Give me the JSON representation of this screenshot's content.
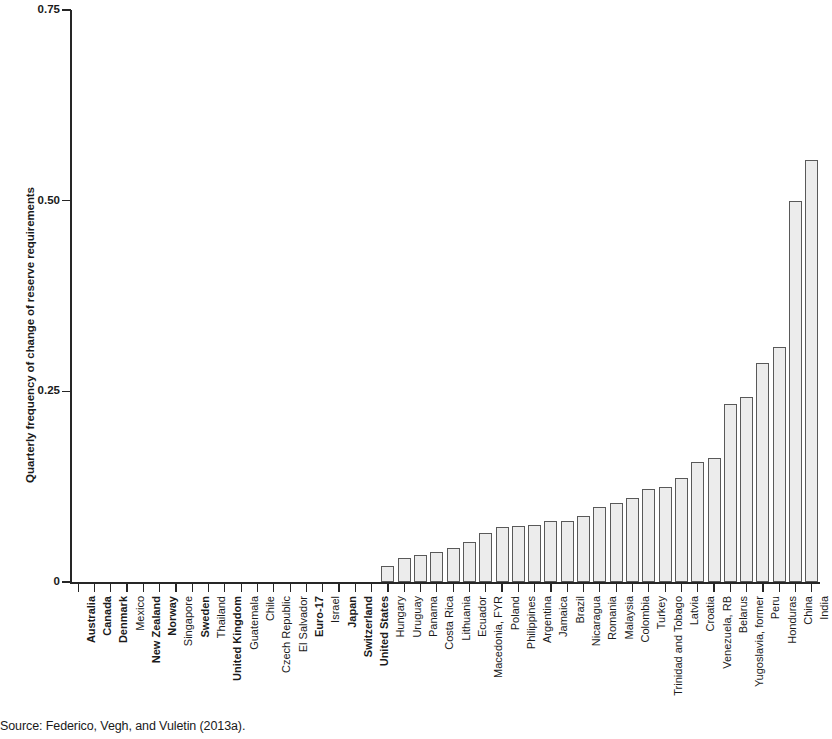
{
  "source_note": "Source: Federico, Vegh, and Vuletin (2013a).",
  "chart_data": {
    "type": "bar",
    "title": "",
    "xlabel": "",
    "ylabel": "Quarterly frequency of change of reserve requirements",
    "ylim": [
      0,
      0.75
    ],
    "ytick_labels": [
      "0",
      "0.25",
      "0.50",
      "0.75"
    ],
    "ytick_values": [
      0,
      0.25,
      0.5,
      0.75
    ],
    "grid": false,
    "legend": null,
    "bar_fill_color": "#ececec",
    "bar_edge_color": "#595959",
    "axis_color": "#262626",
    "categories": [
      "Australia",
      "Canada",
      "Denmark",
      "Mexico",
      "New Zealand",
      "Norway",
      "Singapore",
      "Sweden",
      "Thailand",
      "United Kingdom",
      "Guatemala",
      "Chile",
      "Czech Republic",
      "El Salvador",
      "Euro-17",
      "Israel",
      "Japan",
      "Switzerland",
      "United States",
      "Hungary",
      "Uruguay",
      "Panama",
      "Costa Rica",
      "Lithuania",
      "Ecuador",
      "Macedonia, FYR",
      "Poland",
      "Philippines",
      "Argentina",
      "Jamaica",
      "Brazil",
      "Nicaragua",
      "Romania",
      "Malaysia",
      "Colombia",
      "Turkey",
      "Trinidad and Tobago",
      "Latvia",
      "Croatia",
      "Venezuela, RB",
      "Belarus",
      "Yugoslavia, former",
      "Peru",
      "Honduras",
      "China",
      "India"
    ],
    "values": [
      0,
      0,
      0,
      0,
      0,
      0,
      0,
      0,
      0,
      0,
      0,
      0,
      0,
      0,
      0,
      0,
      0,
      0,
      0,
      0.021,
      0.031,
      0.036,
      0.04,
      0.044,
      0.052,
      0.064,
      0.072,
      0.073,
      0.075,
      0.08,
      0.08,
      0.086,
      0.098,
      0.104,
      0.11,
      0.122,
      0.125,
      0.137,
      0.158,
      0.163,
      0.233,
      0.243,
      0.287,
      0.308,
      0.499,
      0.553
    ],
    "bold_categories": [
      "Australia",
      "Canada",
      "Denmark",
      "New Zealand",
      "Norway",
      "Sweden",
      "United Kingdom",
      "Euro-17",
      "Japan",
      "Switzerland",
      "United States"
    ]
  }
}
